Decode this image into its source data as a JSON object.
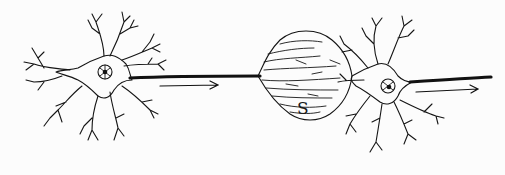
{
  "figure": {
    "synapse_label": "S",
    "arrows": [
      {
        "name": "signal-direction-arrow-1",
        "direction": "right"
      },
      {
        "name": "signal-direction-arrow-2",
        "direction": "right"
      }
    ],
    "colors": {
      "ink": "#151515",
      "paper": "#fcfcfc"
    }
  }
}
